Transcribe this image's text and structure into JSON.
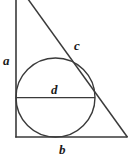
{
  "figure": {
    "background_color": "#ffffff",
    "stroke_color": "#3a3a3a",
    "label_color": "#1a1a1a",
    "width": 131,
    "height": 163,
    "labels": {
      "a": "a",
      "b": "b",
      "c": "c",
      "d": "d"
    },
    "label_meanings": {
      "a": "vertical leg of the triangle",
      "b": "horizontal base of the triangle",
      "c": "hypotenuse of the triangle",
      "d": "diameter of the inscribed circle"
    },
    "geometry": {
      "triangle": {
        "apex_top": [
          28,
          0
        ],
        "vertex_bottom_left": [
          16,
          137
        ],
        "vertex_bottom_right": [
          127,
          137
        ],
        "note": "apex is cropped above the top edge of the image"
      },
      "circle": {
        "center": [
          55.5,
          97.5
        ],
        "radius": 39.5,
        "diameter": 79,
        "tangent_to": [
          "vertical leg a",
          "base b",
          "hypotenuse c"
        ]
      },
      "diameter_segment": {
        "from": [
          16,
          97.5
        ],
        "to": [
          95,
          97.5
        ]
      }
    }
  }
}
